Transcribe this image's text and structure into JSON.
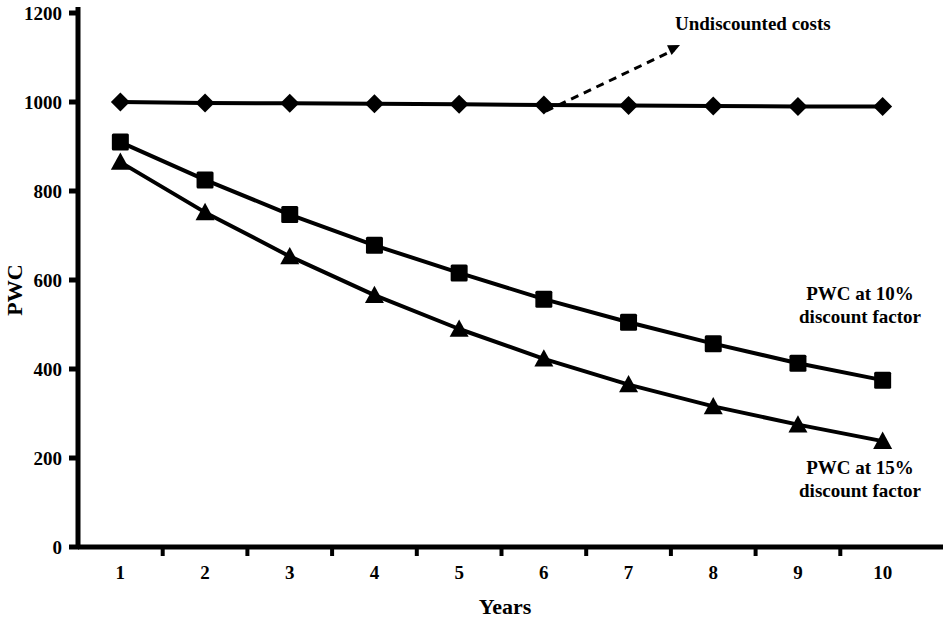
{
  "chart_data": {
    "type": "line",
    "title": "",
    "xlabel": "Years",
    "ylabel": "PWC",
    "categories": [
      1,
      2,
      3,
      4,
      5,
      6,
      7,
      8,
      9,
      10
    ],
    "x_tick_labels": [
      "1",
      "2",
      "3",
      "4",
      "5",
      "6",
      "7",
      "8",
      "9",
      "10"
    ],
    "y_tick_labels": [
      "0",
      "200",
      "400",
      "600",
      "800",
      "1000",
      "1200"
    ],
    "y_ticks": [
      0,
      200,
      400,
      600,
      800,
      1000,
      1200
    ],
    "ylim": [
      0,
      1200
    ],
    "grid": false,
    "legend_position": "inline-annotations",
    "series": [
      {
        "name": "Undiscounted costs",
        "marker": "diamond",
        "values": [
          1000,
          998,
          997,
          996,
          995,
          993,
          992,
          991,
          990,
          990
        ]
      },
      {
        "name": "PWC at 10% discount factor",
        "marker": "square",
        "values": [
          910,
          825,
          747,
          678,
          616,
          557,
          505,
          457,
          413,
          375
        ]
      },
      {
        "name": "PWC at 15% discount factor",
        "marker": "triangle",
        "values": [
          865,
          752,
          653,
          566,
          490,
          423,
          365,
          316,
          275,
          238
        ]
      }
    ],
    "annotations": [
      {
        "id": "undiscounted-costs",
        "text": "Undiscounted costs",
        "lines": [
          "Undiscounted costs"
        ],
        "arrow": true,
        "arrow_from_year": 6,
        "arrow_to_x": 680,
        "arrow_to_y": 45
      },
      {
        "id": "pwc-10",
        "text": "PWC at 10% discount factor",
        "lines": [
          "PWC at 10%",
          "discount factor"
        ],
        "arrow": false
      },
      {
        "id": "pwc-15",
        "text": "PWC at 15% discount factor",
        "lines": [
          "PWC at 15%",
          "discount factor"
        ],
        "arrow": false
      }
    ],
    "colors": {
      "line": "#000000",
      "marker": "#000000",
      "axis": "#000000",
      "background": "#ffffff"
    }
  }
}
